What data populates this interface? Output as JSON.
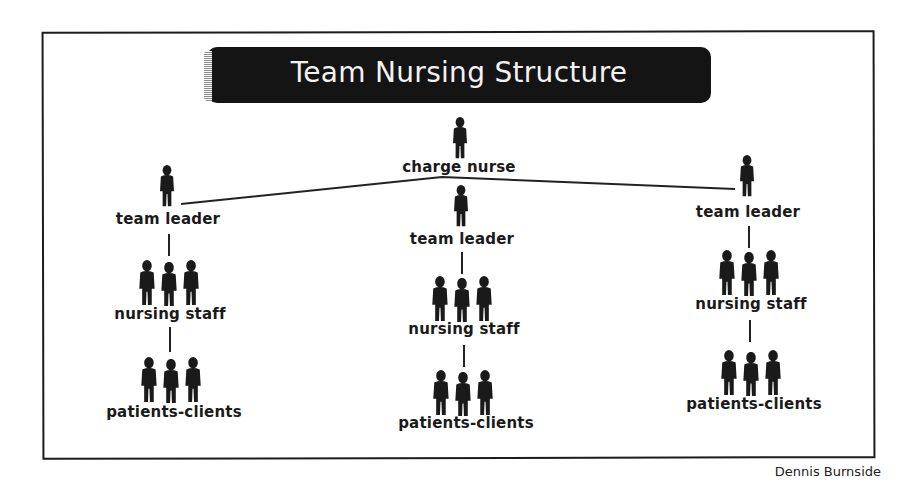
{
  "title": "Team Nursing Structure",
  "credit": "Dennis Burnside",
  "colors": {
    "ink": "#1a1a1a",
    "title_bg": "#141414",
    "title_text": "#f2f2f2",
    "background": "#ffffff"
  },
  "root": {
    "label": "charge nurse",
    "icon": "person-icon"
  },
  "teams": [
    {
      "leader": "team leader",
      "staff": "nursing staff",
      "patients": "patients-clients"
    },
    {
      "leader": "team leader",
      "staff": "nursing staff",
      "patients": "patients-clients"
    },
    {
      "leader": "team leader",
      "staff": "nursing staff",
      "patients": "patients-clients"
    }
  ]
}
